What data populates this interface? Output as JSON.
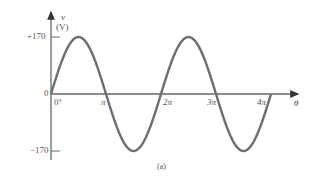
{
  "chart_data": {
    "type": "line",
    "title": "",
    "caption": "(a)",
    "xlabel": "θ",
    "ylabel_symbol": "v",
    "ylabel_unit": "(V)",
    "x_ticks": [
      "0°",
      "π",
      "2π",
      "3π",
      "4π"
    ],
    "x_tick_values": [
      0,
      3.14159,
      6.28319,
      9.42478,
      12.56637
    ],
    "y_ticks": [
      "+170",
      "0",
      "−170"
    ],
    "y_tick_values": [
      170,
      0,
      -170
    ],
    "xlim": [
      0,
      12.566
    ],
    "ylim": [
      -170,
      170
    ],
    "grid": false,
    "series": [
      {
        "name": "v = 170 sin θ",
        "amplitude": 170,
        "x": [
          0,
          0.785,
          1.571,
          2.356,
          3.142,
          3.927,
          4.712,
          5.498,
          6.283,
          7.069,
          7.854,
          8.639,
          9.425,
          10.21,
          10.996,
          11.781,
          12.566
        ],
        "values": [
          0,
          120.2,
          170,
          120.2,
          0,
          -120.2,
          -170,
          -120.2,
          0,
          120.2,
          170,
          120.2,
          0,
          -120.2,
          -170,
          -120.2,
          0
        ]
      }
    ],
    "colors": {
      "curve": "#6e6e6e",
      "axis": "#555555"
    }
  }
}
